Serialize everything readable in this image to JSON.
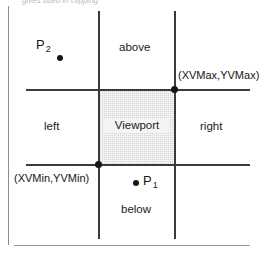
{
  "figure": {
    "header_fragment": "gives  used in clipping",
    "viewport_caption": "Viewport",
    "regions": {
      "above": "above",
      "left": "left",
      "right": "right",
      "below": "below"
    },
    "coordinates": {
      "max_label": "(XVMax,YVMax)",
      "min_label": "(XVMin,YVMin)"
    },
    "points": [
      {
        "id": "p2",
        "base": "P",
        "subscript": "2"
      },
      {
        "id": "p1",
        "base": "P",
        "subscript": "1"
      }
    ],
    "colors": {
      "line": "#3b3b3b",
      "viewport_fill": "#d8d8d8",
      "dot": "#151515",
      "page_rule": "#8d8d8d",
      "text": "#161616"
    }
  },
  "chart_data": {
    "type": "diagram",
    "xlim": [
      0,
      270
    ],
    "ylim": [
      0,
      257
    ],
    "grid": false,
    "clip_lines": {
      "x_min": 98,
      "x_max": 174,
      "y_max": 89,
      "y_min": 164
    },
    "regions": [
      "above",
      "below",
      "left",
      "right",
      "Viewport"
    ],
    "annotations": [
      {
        "text": "(XVMax,YVMax)",
        "x": 174,
        "y": 89
      },
      {
        "text": "(XVMin,YVMin)",
        "x": 98,
        "y": 164
      },
      {
        "text": "P2",
        "x": 60,
        "y": 58
      },
      {
        "text": "P1",
        "x": 136,
        "y": 183
      }
    ]
  }
}
